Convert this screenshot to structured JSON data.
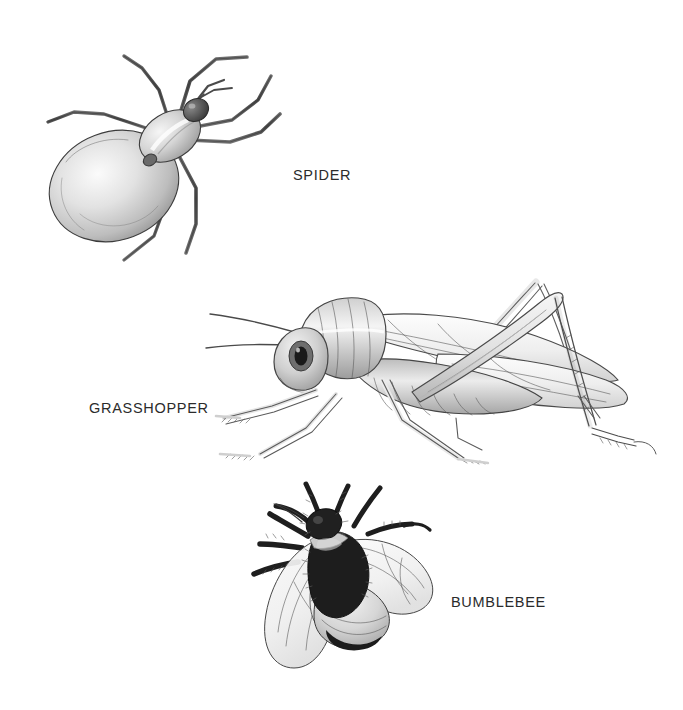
{
  "page": {
    "background_color": "#ffffff",
    "ink_color": "#3c3c3c",
    "label_color": "#2b2b2b",
    "width": 683,
    "height": 710
  },
  "figures": [
    {
      "id": "spider",
      "label": "SPIDER",
      "icon": "spider-illustration",
      "description": "Pencil drawing of a spider seen from above, bulbous abdomen at lower left, eight jointed legs",
      "legs": 8,
      "body_segments": 2,
      "position": {
        "left": 18,
        "top": 28,
        "width": 265,
        "height": 265
      },
      "label_position": {
        "left": 293,
        "top": 168
      }
    },
    {
      "id": "grasshopper",
      "label": "GRASSHOPPER",
      "icon": "grasshopper-illustration",
      "description": "Pencil drawing of a grasshopper in left profile with long folded wings and large jumping hind legs",
      "legs": 6,
      "body_segments": 3,
      "position": {
        "left": 206,
        "top": 268,
        "width": 462,
        "height": 205
      },
      "label_position": {
        "left": 89,
        "top": 401
      }
    },
    {
      "id": "bumblebee",
      "label": "BUMBLEBEE",
      "icon": "bumblebee-illustration",
      "description": "Pencil drawing of a bumblebee viewed from above with dark furry thorax, banded abdomen and four translucent wings",
      "legs": 6,
      "body_segments": 3,
      "position": {
        "left": 232,
        "top": 482,
        "width": 218,
        "height": 190
      },
      "label_position": {
        "left": 451,
        "top": 595
      }
    }
  ]
}
